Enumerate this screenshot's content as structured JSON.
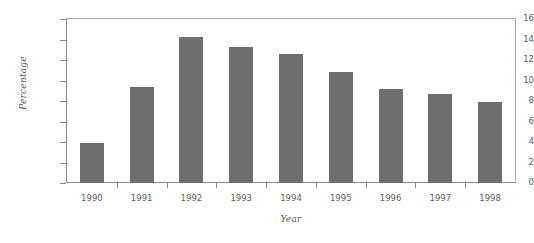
{
  "chart_data": {
    "type": "bar",
    "title": "",
    "subtitle": "",
    "xlabel": "Year",
    "ylabel": "Percentage",
    "categories": [
      "1990",
      "1991",
      "1992",
      "1993",
      "1994",
      "1995",
      "1996",
      "1997",
      "1998"
    ],
    "values": [
      3.9,
      9.4,
      14.2,
      13.3,
      12.6,
      10.8,
      9.2,
      8.7,
      7.9
    ],
    "series": [
      {
        "name": "Percentage",
        "values": [
          3.9,
          9.4,
          14.2,
          13.3,
          12.6,
          10.8,
          9.2,
          8.7,
          7.9
        ]
      }
    ],
    "ylim": [
      0,
      16
    ],
    "ytick_labels": [
      "0",
      "2",
      "4",
      "6",
      "8",
      "10",
      "12",
      "14",
      "16"
    ],
    "ytick_values": [
      0,
      2,
      4,
      6,
      8,
      10,
      12,
      14,
      16
    ],
    "xlim_categories": 9,
    "grid": false,
    "legend": false,
    "legend_position": "none",
    "bar_color": "#6e6e6e",
    "axis_color": "#8a8a8c",
    "text_color": "#5d5d5f",
    "background": "#ffffff"
  }
}
